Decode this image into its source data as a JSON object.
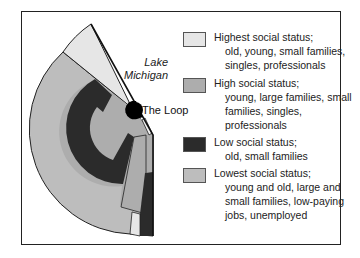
{
  "labels": {
    "lake": "Lake Michigan",
    "lake_line1": "Lake",
    "lake_line2": "Michigan",
    "loop": "The Loop"
  },
  "colors": {
    "highest": "#e6e6e6",
    "high": "#adadad",
    "low": "#2b2b2b",
    "lowest": "#bdbdbd",
    "loop": "#000000",
    "border": "#222222"
  },
  "legend": [
    {
      "key": "highest",
      "title": "Highest social status;",
      "desc": "old, young, small families, singles, professionals",
      "color": "#e6e6e6"
    },
    {
      "key": "high",
      "title": "High social status;",
      "desc": "young, large families, small families, singles, professionals",
      "color": "#adadad"
    },
    {
      "key": "low",
      "title": "Low social status;",
      "desc": "old, small families",
      "color": "#2b2b2b"
    },
    {
      "key": "lowest",
      "title": "Lowest social status;",
      "desc": "young and old, large and small families, low-paying jobs, unemployed",
      "color": "#bdbdbd"
    }
  ]
}
